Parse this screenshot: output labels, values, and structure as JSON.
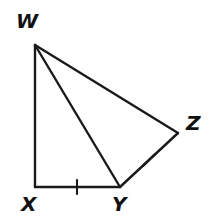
{
  "figure": {
    "name": "Quadrilateral WXYZ with diagonal WY",
    "background_color": "#ffffff",
    "stroke_color": "#1a1a1a",
    "canvas": {
      "width": 211,
      "height": 223
    },
    "vertices": [
      {
        "id": "W",
        "label": "W",
        "x": 35,
        "y": 45,
        "label_x": 16,
        "label_y": 11
      },
      {
        "id": "X",
        "label": "X",
        "x": 35,
        "y": 187,
        "label_x": 21,
        "label_y": 194
      },
      {
        "id": "Y",
        "label": "Y",
        "x": 120,
        "y": 187,
        "label_x": 112,
        "label_y": 194
      },
      {
        "id": "Z",
        "label": "Z",
        "x": 178,
        "y": 133,
        "label_x": 186,
        "label_y": 113
      }
    ],
    "segments": [
      {
        "id": "WX",
        "from": "W",
        "to": "X",
        "x1": 35,
        "y1": 45,
        "x2": 35,
        "y2": 187
      },
      {
        "id": "XY",
        "from": "X",
        "to": "Y",
        "x1": 35,
        "y1": 187,
        "x2": 120,
        "y2": 187
      },
      {
        "id": "YZ",
        "from": "Y",
        "to": "Z",
        "x1": 120,
        "y1": 187,
        "x2": 178,
        "y2": 133
      },
      {
        "id": "WZ",
        "from": "W",
        "to": "Z",
        "x1": 35,
        "y1": 45,
        "x2": 178,
        "y2": 133
      },
      {
        "id": "WY",
        "from": "W",
        "to": "Y",
        "x1": 35,
        "y1": 45,
        "x2": 120,
        "y2": 187
      }
    ],
    "tick_marks": [
      {
        "id": "tick-XY",
        "on_segment": "XY",
        "count": 1,
        "x1": 77,
        "y1": 180,
        "x2": 77,
        "y2": 194
      },
      {
        "id": "tick-YZ",
        "on_segment": "YZ",
        "count": 1,
        "x1": 143,
        "y1": 166,
        "x2": 155,
        "y2": 154
      }
    ]
  }
}
